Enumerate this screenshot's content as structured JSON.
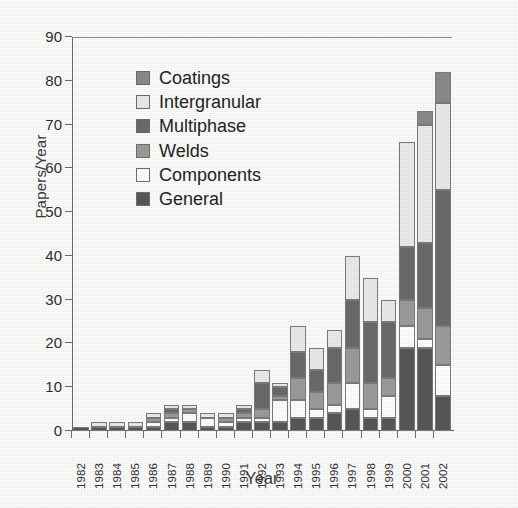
{
  "chart_data": {
    "type": "bar",
    "subtype": "stacked-vertical",
    "title": "",
    "xlabel": "Year",
    "ylabel": "Papers/Year",
    "ylim": [
      0,
      90
    ],
    "ytick_step": 10,
    "yticks": [
      0,
      10,
      20,
      30,
      40,
      50,
      60,
      70,
      80,
      90
    ],
    "grid": false,
    "legend_position": "inside-upper-left",
    "categories": [
      "1982",
      "1983",
      "1984",
      "1985",
      "1986",
      "1987",
      "1988",
      "1989",
      "1990",
      "1991",
      "1992",
      "1993",
      "1994",
      "1995",
      "1996",
      "1997",
      "1998",
      "1999",
      "2000",
      "2001",
      "2002"
    ],
    "stack_order_bottom_to_top": [
      "General",
      "Components",
      "Welds",
      "Multiphase",
      "Intergranular",
      "Coatings"
    ],
    "series": [
      {
        "name": "General",
        "color": "#585858",
        "values": [
          1,
          1,
          1,
          1,
          1,
          2,
          2,
          1,
          1,
          2,
          2,
          2,
          3,
          3,
          4,
          5,
          3,
          3,
          19,
          19,
          8
        ]
      },
      {
        "name": "Components",
        "color": "#ffffff",
        "values": [
          0,
          0,
          0,
          0,
          1,
          1,
          2,
          2,
          1,
          1,
          1,
          5,
          4,
          2,
          2,
          6,
          2,
          5,
          5,
          2,
          7
        ]
      },
      {
        "name": "Welds",
        "color": "#9c9c9c",
        "values": [
          0,
          0,
          0,
          0,
          1,
          1,
          1,
          0,
          1,
          1,
          2,
          1,
          5,
          4,
          5,
          8,
          6,
          4,
          6,
          7,
          9
        ]
      },
      {
        "name": "Multiphase",
        "color": "#6b6b6b",
        "values": [
          0,
          0,
          0,
          0,
          0,
          1,
          0,
          0,
          0,
          1,
          6,
          2,
          6,
          5,
          8,
          11,
          14,
          13,
          12,
          15,
          31
        ]
      },
      {
        "name": "Intergranular",
        "color": "#ebebeb",
        "values": [
          0,
          1,
          1,
          1,
          1,
          1,
          1,
          1,
          1,
          1,
          3,
          1,
          6,
          5,
          4,
          10,
          10,
          5,
          24,
          27,
          20
        ]
      },
      {
        "name": "Coatings",
        "color": "#8a8a8a",
        "values": [
          0,
          0,
          0,
          0,
          0,
          0,
          0,
          0,
          0,
          0,
          0,
          0,
          0,
          0,
          0,
          0,
          0,
          0,
          0,
          3,
          7
        ]
      }
    ],
    "totals": [
      1,
      2,
      2,
      2,
      4,
      6,
      6,
      4,
      4,
      6,
      14,
      11,
      24,
      19,
      23,
      40,
      35,
      30,
      66,
      73,
      82
    ]
  },
  "axes": {
    "y_title": "Papers/Year",
    "x_title": "Year",
    "y_tick_labels": [
      "0",
      "10",
      "20",
      "30",
      "40",
      "50",
      "60",
      "70",
      "80",
      "90"
    ],
    "x_tick_labels": [
      "1982",
      "1983",
      "1984",
      "1985",
      "1986",
      "1987",
      "1988",
      "1989",
      "1990",
      "1991",
      "1992",
      "1993",
      "1994",
      "1995",
      "1996",
      "1997",
      "1998",
      "1999",
      "2000",
      "2001",
      "2002"
    ]
  },
  "legend": {
    "items": [
      {
        "label": "Coatings",
        "color": "#8a8a8a"
      },
      {
        "label": "Intergranular",
        "color": "#ebebeb"
      },
      {
        "label": "Multiphase",
        "color": "#6b6b6b"
      },
      {
        "label": "Welds",
        "color": "#9c9c9c"
      },
      {
        "label": "Components",
        "color": "#ffffff"
      },
      {
        "label": "General",
        "color": "#585858"
      }
    ]
  }
}
